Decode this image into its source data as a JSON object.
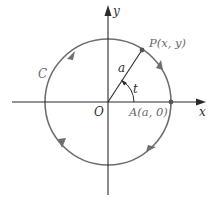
{
  "figure": {
    "axes": {
      "x_label": "x",
      "y_label": "y"
    },
    "labels": {
      "origin": "O",
      "point_p": "P(x, y)",
      "point_a": "A(a, 0)",
      "curve": "C",
      "radius": "a",
      "angle": "t"
    },
    "colors": {
      "axis": "#2a2a2a",
      "circle": "#6e6e6e",
      "text": "#333333"
    }
  }
}
